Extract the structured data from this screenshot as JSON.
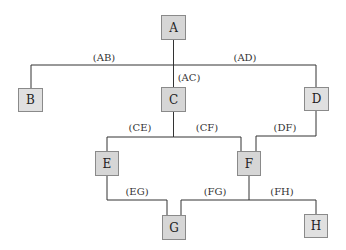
{
  "diagram": {
    "colors": {
      "node_fill": "#d6d6d6",
      "node_fill_light": "#e0e0e0",
      "edge": "#333333"
    },
    "nodes": [
      {
        "id": "A",
        "label": "A",
        "x": 161,
        "y": 15,
        "w": 25,
        "h": 25
      },
      {
        "id": "B",
        "label": "B",
        "x": 18,
        "y": 88,
        "w": 25,
        "h": 24
      },
      {
        "id": "C",
        "label": "C",
        "x": 161,
        "y": 87,
        "w": 25,
        "h": 25
      },
      {
        "id": "D",
        "label": "D",
        "x": 304,
        "y": 87,
        "w": 25,
        "h": 24
      },
      {
        "id": "E",
        "label": "E",
        "x": 95,
        "y": 151,
        "w": 24,
        "h": 25
      },
      {
        "id": "F",
        "label": "F",
        "x": 237,
        "y": 151,
        "w": 24,
        "h": 25
      },
      {
        "id": "G",
        "label": "G",
        "x": 162,
        "y": 215,
        "w": 24,
        "h": 25
      },
      {
        "id": "H",
        "label": "H",
        "x": 304,
        "y": 214,
        "w": 24,
        "h": 24
      }
    ],
    "edges": [
      {
        "id": "AB",
        "label": "(AB)",
        "lx": 104,
        "ly": 52
      },
      {
        "id": "AC",
        "label": "(AC)",
        "lx": 189,
        "ly": 72
      },
      {
        "id": "AD",
        "label": "(AD)",
        "lx": 245,
        "ly": 52
      },
      {
        "id": "CE",
        "label": "(CE)",
        "lx": 140,
        "ly": 122
      },
      {
        "id": "CF",
        "label": "(CF)",
        "lx": 207,
        "ly": 122
      },
      {
        "id": "DF",
        "label": "(DF)",
        "lx": 285,
        "ly": 122
      },
      {
        "id": "EG",
        "label": "(EG)",
        "lx": 137,
        "ly": 186
      },
      {
        "id": "FG",
        "label": "(FG)",
        "lx": 215,
        "ly": 186
      },
      {
        "id": "FH",
        "label": "(FH)",
        "lx": 282,
        "ly": 186
      }
    ]
  }
}
